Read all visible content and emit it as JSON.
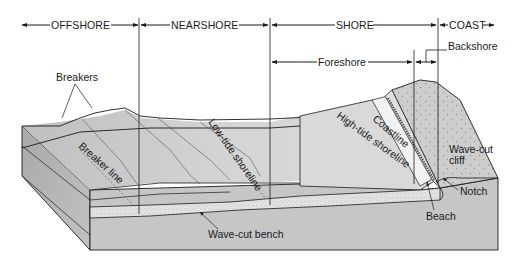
{
  "zones": {
    "offshore": "OFFSHORE",
    "nearshore": "NEARSHORE",
    "shore": "SHORE",
    "coast": "COAST"
  },
  "subzones": {
    "foreshore": "Foreshore",
    "backshore": "Backshore"
  },
  "labels": {
    "breakers": "Breakers",
    "breaker_line": "Breaker line",
    "low_tide_shoreline": "Low-tide shoreline",
    "high_tide_shoreline": "High-tide shoreline",
    "coastline": "Coastline",
    "wave_cut_cliff_1": "Wave-cut",
    "wave_cut_cliff_2": "cliff",
    "notch": "Notch",
    "beach": "Beach",
    "wave_cut_bench": "Wave-cut bench"
  },
  "colors": {
    "background": "#ffffff",
    "water_light": "#d9d9d9",
    "water_mid": "#c4c4c4",
    "block_side": "#bdbdbd",
    "block_front": "#c8c8c8",
    "sand": "#e6e6e6",
    "cliff": "#cfcfcf",
    "line": "#1a1a1a"
  }
}
